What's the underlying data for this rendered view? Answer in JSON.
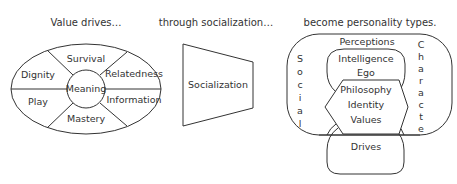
{
  "headers": {
    "left": "Value drives…",
    "middle": "through socialization…",
    "right": "become personality types."
  },
  "value_drives": {
    "center": "Meaning",
    "segments": [
      "Survival",
      "Relatedness",
      "Information",
      "Mastery",
      "Play",
      "Dignity"
    ]
  },
  "socialization": {
    "label": "Socialization"
  },
  "personality": {
    "outer_left_vertical": "Social",
    "outer_right_vertical": "Character",
    "perceptions": "Perceptions",
    "inner_top": [
      "Intelligence",
      "Ego"
    ],
    "hexagon": [
      "Philosophy",
      "Identity",
      "Values"
    ],
    "bottom": "Drives"
  }
}
